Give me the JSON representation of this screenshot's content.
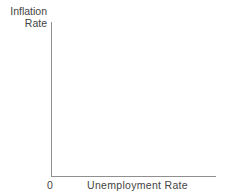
{
  "chart_data": {
    "type": "line",
    "title": "",
    "xlabel": "Unemployment Rate",
    "ylabel": "Inflation Rate",
    "ylabel_lines": "Inflation\nRate",
    "origin_label": "0",
    "series": [],
    "axes_only": true,
    "grid": false,
    "legend": false,
    "axis_color": "#8f8f8f",
    "text_color": "#444444",
    "background_color": "#ffffff"
  }
}
